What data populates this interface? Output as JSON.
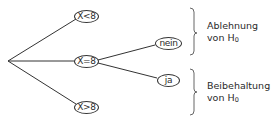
{
  "diagram": {
    "type": "decision-tree",
    "root": {
      "label": ""
    },
    "first_level": [
      {
        "id": "lt",
        "label": "X<8"
      },
      {
        "id": "eq",
        "label": "X=8"
      },
      {
        "id": "gt",
        "label": "X>8"
      }
    ],
    "second_level": [
      {
        "parent": "eq",
        "id": "nein",
        "label": "nein"
      },
      {
        "parent": "eq",
        "id": "ja",
        "label": "ja"
      }
    ],
    "outcomes": [
      {
        "line1": "Ablehnung",
        "line2_prefix": "von H",
        "line2_sub": "0"
      },
      {
        "line1": "Beibehaltung",
        "line2_prefix": "von H",
        "line2_sub": "0"
      }
    ],
    "colors": {
      "line": "#333333",
      "brace": "#666666",
      "text": "#2a2a2a",
      "background": "#ffffff"
    }
  }
}
